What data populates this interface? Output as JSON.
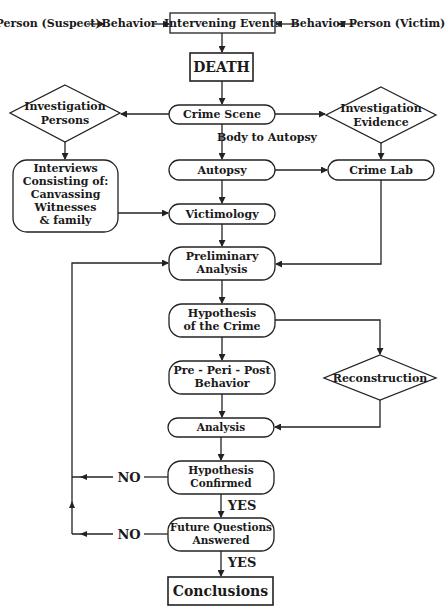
{
  "diagram": {
    "type": "flowchart",
    "top_row": {
      "suspect": "Person (Suspect)",
      "behavior_left": "Behavior",
      "intervening": "Intervening Events",
      "behavior_right": "Behavior",
      "victim": "Person (Victim)"
    },
    "nodes": {
      "death": "DEATH",
      "crime_scene": "Crime Scene",
      "inv_persons": [
        "Investigation",
        "Persons"
      ],
      "inv_evidence": [
        "Investigation",
        "Evidence"
      ],
      "body_to_autopsy": "Body to Autopsy",
      "interviews": [
        "Interviews",
        "Consisting of:",
        "Canvassing",
        "Witnesses",
        "& family"
      ],
      "autopsy": "Autopsy",
      "crime_lab": "Crime Lab",
      "victimology": "Victimology",
      "preliminary": [
        "Preliminary",
        "Analysis"
      ],
      "hypothesis": [
        "Hypothesis",
        "of the Crime"
      ],
      "ppp": [
        "Pre - Peri - Post",
        "Behavior"
      ],
      "reconstruction": "Reconstruction",
      "analysis": "Analysis",
      "confirmed": [
        "Hypothesis",
        "Confirmed"
      ],
      "future": [
        "Future Questions",
        "Answered"
      ],
      "conclusions": "Conclusions"
    },
    "labels": {
      "no1": "NO",
      "no2": "NO",
      "yes1": "YES",
      "yes2": "YES"
    },
    "colors": {
      "stroke": "#222222",
      "text": "#1a1a1a",
      "background": "#ffffff"
    }
  }
}
